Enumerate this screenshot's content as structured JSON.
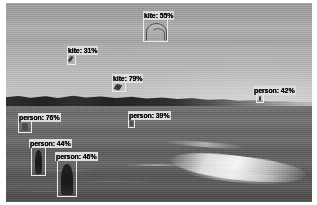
{
  "image": {
    "scene_description": "Beach scene with overcast sky, distant treeline, lake water and breaking wave",
    "width": 317,
    "height": 205
  },
  "overlay": {
    "label_background_color": "#dcdcd6",
    "label_text_color": "#101010",
    "box_border_color": "#e9e9e4"
  },
  "detections": [
    {
      "id": "kite-55",
      "class": "kite",
      "confidence": "55%",
      "label": "kite: 55%",
      "label_left": 143,
      "label_top": 11,
      "box_left": 143,
      "box_top": 19,
      "box_width": 25,
      "box_height": 23,
      "subject": "kite-arc"
    },
    {
      "id": "kite-31",
      "class": "kite",
      "confidence": "31%",
      "label": "kite: 31%",
      "label_left": 67,
      "label_top": 46,
      "box_left": 67,
      "box_top": 54,
      "box_width": 9,
      "box_height": 11,
      "subject": "kite-small"
    },
    {
      "id": "kite-79",
      "class": "kite",
      "confidence": "79%",
      "label": "kite: 79%",
      "label_left": 112,
      "label_top": 74,
      "box_left": 112,
      "box_top": 82,
      "box_width": 14,
      "box_height": 10,
      "subject": "kite-small"
    },
    {
      "id": "person-42",
      "class": "person",
      "confidence": "42%",
      "label": "person: 42%",
      "label_left": 253,
      "label_top": 86,
      "box_left": 256,
      "box_top": 94,
      "box_width": 8,
      "box_height": 9,
      "subject": "person-dot"
    },
    {
      "id": "person-39",
      "class": "person",
      "confidence": "39%",
      "label": "person: 39%",
      "label_left": 128,
      "label_top": 111,
      "box_left": 128,
      "box_top": 119,
      "box_width": 7,
      "box_height": 9,
      "subject": "person-tiny"
    },
    {
      "id": "person-76",
      "class": "person",
      "confidence": "76%",
      "label": "person: 76%",
      "label_left": 18,
      "label_top": 113,
      "box_left": 18,
      "box_top": 121,
      "box_width": 14,
      "box_height": 12,
      "subject": "person-tiny"
    },
    {
      "id": "person-44",
      "class": "person",
      "confidence": "44%",
      "label": "person: 44%",
      "label_left": 29,
      "label_top": 139,
      "box_left": 31,
      "box_top": 147,
      "box_width": 15,
      "box_height": 29,
      "subject": "person-fig"
    },
    {
      "id": "person-46",
      "class": "person",
      "confidence": "46%",
      "label": "person: 46%",
      "label_left": 55,
      "label_top": 152,
      "box_left": 57,
      "box_top": 160,
      "box_width": 20,
      "box_height": 37,
      "subject": "person-fig-wide"
    }
  ]
}
